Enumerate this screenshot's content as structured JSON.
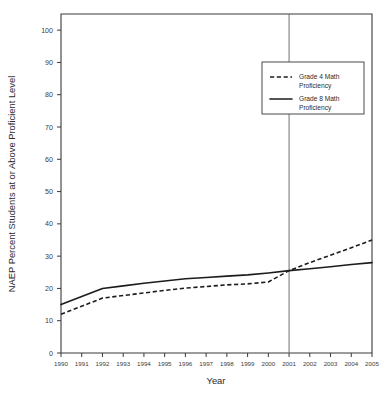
{
  "chart_data": {
    "type": "line",
    "title": "",
    "xlabel": "Year",
    "ylabel": "NAEP Percent Students at or Above Proficient Level",
    "categories": [
      1990,
      1991,
      1992,
      1993,
      1994,
      1995,
      1996,
      1997,
      1998,
      1999,
      2000,
      2001,
      2002,
      2003,
      2004,
      2005
    ],
    "xtick_labels": [
      "1990",
      "1991",
      "1992",
      "1993",
      "1994",
      "1995",
      "1996",
      "1997",
      "1998",
      "1999",
      "2000",
      "2001",
      "2002",
      "2003",
      "2004",
      "2005"
    ],
    "ytick_labels": [
      "0",
      "10",
      "20",
      "30",
      "40",
      "50",
      "60",
      "70",
      "80",
      "90",
      "100"
    ],
    "ytick_values": [
      0,
      10,
      20,
      30,
      40,
      50,
      60,
      70,
      80,
      90,
      100
    ],
    "xlim": [
      1990,
      2005
    ],
    "ylim": [
      0,
      105
    ],
    "grid": false,
    "legend_position": "upper right",
    "series": [
      {
        "name": "Grade 4 Math Proficiency",
        "style": "dashed",
        "color": "#1c1c1c",
        "values": [
          12,
          14.5,
          17,
          17.8,
          18.6,
          19.4,
          20.1,
          20.6,
          21.1,
          21.4,
          22,
          25.5,
          28,
          30.3,
          32.6,
          35
        ]
      },
      {
        "name": "Grade 8 Math Proficiency",
        "style": "solid",
        "color": "#1c1c1c",
        "values": [
          15,
          17.5,
          20,
          20.8,
          21.6,
          22.3,
          23,
          23.4,
          23.8,
          24.2,
          24.8,
          25.5,
          26.1,
          26.7,
          27.4,
          28
        ]
      }
    ],
    "reference_line": {
      "name": "year-2001-reference",
      "orientation": "vertical",
      "value": 2001,
      "color": "#6f6f6f"
    },
    "legend_entries": [
      {
        "label_line1": "Grade 4 Math",
        "label_line2": "Proficiency",
        "style": "dashed"
      },
      {
        "label_line1": "Grade 8 Math",
        "label_line2": "Proficiency",
        "style": "solid"
      }
    ]
  }
}
